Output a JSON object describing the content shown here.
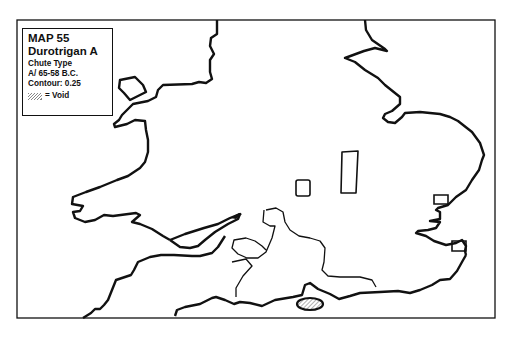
{
  "legend": {
    "map_number": "MAP 55",
    "coin_series": "Durotrigan A",
    "type_line": "Chute Type",
    "date_line": "A/  65-58 B.C.",
    "contour_line": "Contour: 0.25",
    "void_label": "= Void",
    "void_swatch": "hatched-pattern"
  },
  "map": {
    "region": "Southern Britain (England & Wales)",
    "features": [
      {
        "name": "coastline",
        "type": "outline"
      },
      {
        "name": "contour-0.25",
        "type": "contour",
        "description": "Wessex/Dorset area distribution contour"
      },
      {
        "name": "void-isle-of-wight",
        "type": "void-hatched"
      },
      {
        "name": "void-midlands-small",
        "type": "rectangle"
      },
      {
        "name": "void-midlands-tall",
        "type": "rectangle"
      },
      {
        "name": "void-east-anglia-coast",
        "type": "rectangle"
      },
      {
        "name": "void-kent-coast",
        "type": "rectangle"
      }
    ],
    "colors": {
      "line": "#111111",
      "background": "#ffffff",
      "hatch": "#888888"
    }
  }
}
